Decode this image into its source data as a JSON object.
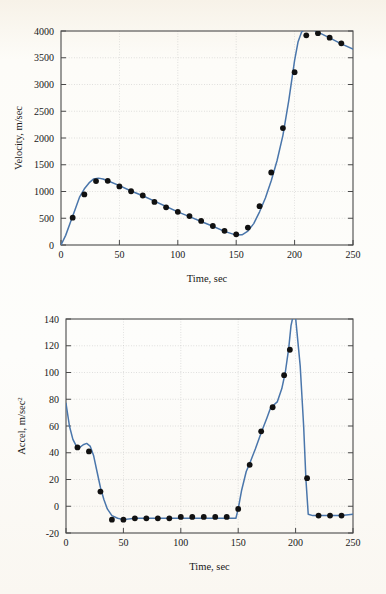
{
  "page": {
    "background_color": "#fbf8f2",
    "curve_color": "#4a76ab",
    "marker_color": "#111111",
    "frame_color": "#4a4a4a",
    "grid_color": "#b9b9b9"
  },
  "chart_data": [
    {
      "id": "velocity-vs-time",
      "type": "line",
      "title": "",
      "xlabel": "Time, sec",
      "ylabel": "Velocity, m/sec",
      "xlim": [
        0,
        250
      ],
      "ylim": [
        0,
        4000
      ],
      "xticks": [
        0,
        50,
        100,
        150,
        200,
        250
      ],
      "yticks": [
        0,
        500,
        1000,
        1500,
        2000,
        2500,
        3000,
        3500,
        4000
      ],
      "grid": true,
      "legend": "none",
      "series": [
        {
          "name": "velocity-curve",
          "style": "line",
          "x": [
            0,
            4,
            8,
            12,
            16,
            20,
            24,
            28,
            32,
            36,
            40,
            50,
            60,
            70,
            80,
            90,
            100,
            110,
            120,
            130,
            140,
            150,
            155,
            160,
            165,
            170,
            175,
            180,
            185,
            190,
            195,
            200,
            203,
            206,
            210,
            215,
            220,
            230,
            240,
            250
          ],
          "y": [
            0,
            180,
            420,
            660,
            900,
            1050,
            1160,
            1235,
            1250,
            1235,
            1200,
            1110,
            1010,
            920,
            820,
            720,
            620,
            530,
            440,
            350,
            255,
            185,
            190,
            260,
            400,
            620,
            880,
            1200,
            1580,
            2050,
            2700,
            3450,
            3800,
            3980,
            4060,
            4030,
            3980,
            3870,
            3760,
            3660
          ]
        },
        {
          "name": "velocity-data-points",
          "style": "markers",
          "x": [
            10,
            20,
            30,
            40,
            50,
            60,
            70,
            80,
            90,
            100,
            110,
            120,
            130,
            140,
            150,
            160,
            170,
            180,
            190,
            200,
            210,
            220,
            230,
            240
          ],
          "y": [
            510,
            945,
            1195,
            1200,
            1095,
            1005,
            925,
            805,
            705,
            620,
            540,
            450,
            355,
            265,
            200,
            325,
            725,
            1355,
            2185,
            3230,
            3920,
            3960,
            3875,
            3770
          ]
        }
      ]
    },
    {
      "id": "acceleration-vs-time",
      "type": "line",
      "title": "",
      "xlabel": "Time, sec",
      "ylabel": "Accel, m/sec2",
      "ylabel_base": "Accel, m/sec",
      "ylabel_exponent": "2",
      "xlim": [
        0,
        250
      ],
      "ylim": [
        -20,
        140
      ],
      "xticks": [
        0,
        50,
        100,
        150,
        200,
        250
      ],
      "yticks": [
        -20,
        0,
        20,
        40,
        60,
        80,
        100,
        120,
        140
      ],
      "grid": true,
      "legend": "none",
      "series": [
        {
          "name": "acceleration-curve",
          "style": "line",
          "x": [
            0,
            3,
            6,
            9,
            12,
            15,
            18,
            21,
            24,
            27,
            30,
            33,
            36,
            40,
            45,
            50,
            60,
            70,
            80,
            90,
            100,
            110,
            120,
            130,
            140,
            148,
            150,
            153,
            157,
            160,
            165,
            170,
            175,
            178,
            180,
            184,
            188,
            191,
            194,
            196,
            198,
            200,
            204,
            207,
            209,
            211,
            215,
            220,
            230,
            240,
            250
          ],
          "y": [
            77,
            60,
            50,
            45,
            44,
            46,
            47,
            45,
            38,
            26,
            14,
            5,
            -2,
            -7,
            -9,
            -10,
            -9,
            -9,
            -9,
            -9,
            -9,
            -9,
            -9,
            -9,
            -9,
            -9,
            -2,
            12,
            26,
            32,
            43,
            55,
            66,
            73,
            75,
            78,
            88,
            100,
            118,
            135,
            143,
            141,
            105,
            60,
            20,
            -6,
            -7,
            -7,
            -7,
            -7,
            -6
          ]
        },
        {
          "name": "acceleration-data-points",
          "style": "markers",
          "x": [
            10,
            20,
            30,
            40,
            50,
            60,
            70,
            80,
            90,
            100,
            110,
            120,
            130,
            140,
            150,
            160,
            170,
            180,
            190,
            195,
            210,
            220,
            230,
            240
          ],
          "y": [
            44,
            41,
            11,
            -10,
            -10,
            -9,
            -9,
            -9,
            -9,
            -8,
            -8,
            -8,
            -8,
            -8,
            -2,
            31,
            56,
            74,
            98,
            117,
            21,
            -7,
            -7,
            -7
          ]
        }
      ]
    }
  ]
}
